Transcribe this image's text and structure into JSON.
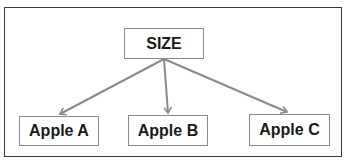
{
  "diagram": {
    "type": "tree",
    "root": {
      "label": "SIZE"
    },
    "children": [
      {
        "label": "Apple A"
      },
      {
        "label": "Apple B"
      },
      {
        "label": "Apple C"
      }
    ],
    "edges": [
      {
        "from": "SIZE",
        "to": "Apple A"
      },
      {
        "from": "SIZE",
        "to": "Apple B"
      },
      {
        "from": "SIZE",
        "to": "Apple C"
      }
    ],
    "colors": {
      "frame_border": "#3a3a3a",
      "node_border": "#8a8a8a",
      "arrow": "#8a8a8a",
      "text": "#1a1a1a",
      "background": "#ffffff"
    }
  }
}
